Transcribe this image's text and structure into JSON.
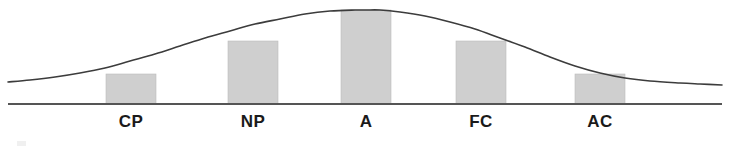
{
  "figure": {
    "background_color": "#ffffff",
    "width": 730,
    "height": 156
  },
  "axis": {
    "baseline_color": "#555555",
    "baseline_y": 104,
    "baseline_x_start": 8,
    "baseline_x_end": 722
  },
  "curve": {
    "name": "normal-distribution-curve",
    "color": "#3c3c3c",
    "stroke_width": 1.6
  },
  "labels": [
    {
      "text": "CP",
      "x": 131
    },
    {
      "text": "NP",
      "x": 253
    },
    {
      "text": "A",
      "x": 366
    },
    {
      "text": "FC",
      "x": 481
    },
    {
      "text": "AC",
      "x": 600
    }
  ],
  "bars": {
    "fill_color": "#cfcfcf",
    "edge_color": "#bdbdbd",
    "width": 50
  },
  "chart_data": {
    "type": "area",
    "title": "",
    "subtitle": "",
    "xlabel": "",
    "ylabel": "",
    "grid": false,
    "legend": false,
    "curve_type": "gaussian",
    "categories": [
      "CP",
      "NP",
      "A",
      "FC",
      "AC"
    ],
    "series": [
      {
        "name": "Egogram band heights (normal curve)",
        "values": [
          30,
          63,
          94,
          63,
          30
        ]
      }
    ],
    "bands": [
      {
        "label": "CP",
        "x_left": 106,
        "x_right": 156,
        "center": 131,
        "height_px": 30,
        "top_y": 74
      },
      {
        "label": "NP",
        "x_left": 228,
        "x_right": 278,
        "center": 253,
        "height_px": 63,
        "top_y": 41
      },
      {
        "label": "A",
        "x_left": 341,
        "x_right": 391,
        "center": 366,
        "height_px": 94,
        "top_y": 10
      },
      {
        "label": "FC",
        "x_left": 456,
        "x_right": 506,
        "center": 481,
        "height_px": 63,
        "top_y": 41
      },
      {
        "label": "AC",
        "x_left": 575,
        "x_right": 625,
        "center": 600,
        "height_px": 30,
        "top_y": 74
      }
    ],
    "curve_points": [
      [
        8,
        82
      ],
      [
        30,
        80
      ],
      [
        55,
        77
      ],
      [
        80,
        73
      ],
      [
        105,
        68
      ],
      [
        130,
        61
      ],
      [
        155,
        54
      ],
      [
        180,
        46
      ],
      [
        205,
        38
      ],
      [
        230,
        31
      ],
      [
        255,
        24
      ],
      [
        280,
        19
      ],
      [
        305,
        14
      ],
      [
        330,
        11
      ],
      [
        355,
        10
      ],
      [
        366,
        10
      ],
      [
        380,
        10
      ],
      [
        400,
        12
      ],
      [
        425,
        16
      ],
      [
        450,
        22
      ],
      [
        475,
        29
      ],
      [
        500,
        38
      ],
      [
        525,
        47
      ],
      [
        550,
        57
      ],
      [
        575,
        66
      ],
      [
        600,
        73
      ],
      [
        625,
        78
      ],
      [
        650,
        81
      ],
      [
        680,
        83
      ],
      [
        700,
        84
      ],
      [
        722,
        85
      ]
    ],
    "ylim": [
      0,
      104
    ],
    "xlim": [
      8,
      722
    ]
  }
}
